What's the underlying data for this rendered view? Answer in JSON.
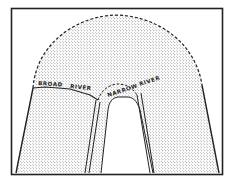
{
  "diagram": {
    "type": "stippled cross-section diagram",
    "labels": {
      "broad_river_1": "BROAD",
      "broad_river_2": "RIVER",
      "narrow_river_1": "NARROW",
      "narrow_river_2": "RIVER"
    },
    "colors": {
      "ink": "#222222",
      "background": "#ffffff",
      "stipple": "#444444"
    }
  }
}
